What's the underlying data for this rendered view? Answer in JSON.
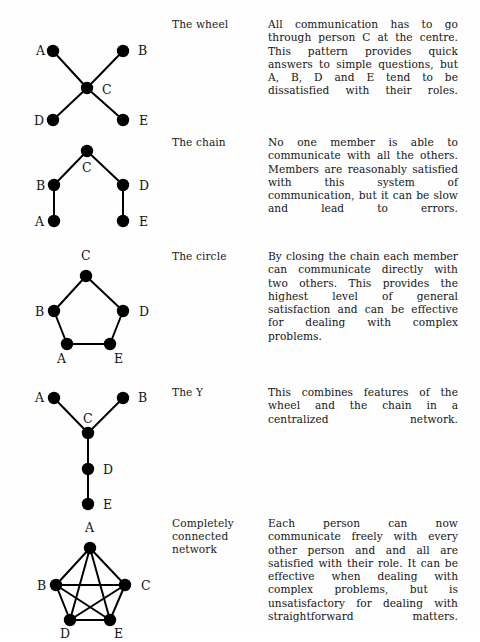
{
  "page": {
    "width": 480,
    "height": 630,
    "background": "#fefefe",
    "ink_color": "#141414",
    "node_color": "#000000",
    "edge_color": "#000000"
  },
  "rows": [
    {
      "id": "wheel",
      "label": "The wheel",
      "description": "All communication has to go through person C at the centre. This pattern provides quick answers to simple questions, but A, B, D and E tend to be dissatisfied with their roles.",
      "diagram": {
        "type": "network-graph",
        "name": "wheel-diagram",
        "nodes": [
          {
            "id": "A",
            "label": "A",
            "x": 47,
            "y": 33,
            "label_x": 30,
            "label_y": 37
          },
          {
            "id": "B",
            "label": "B",
            "x": 117,
            "y": 33,
            "label_x": 132,
            "label_y": 37
          },
          {
            "id": "C",
            "label": "C",
            "x": 81,
            "y": 70,
            "label_x": 96,
            "label_y": 76
          },
          {
            "id": "D",
            "label": "D",
            "x": 47,
            "y": 102,
            "label_x": 28,
            "label_y": 107
          },
          {
            "id": "E",
            "label": "E",
            "x": 117,
            "y": 102,
            "label_x": 133,
            "label_y": 107
          }
        ],
        "edges": [
          [
            "A",
            "C"
          ],
          [
            "B",
            "C"
          ],
          [
            "C",
            "D"
          ],
          [
            "C",
            "E"
          ]
        ]
      }
    },
    {
      "id": "chain",
      "label": "The chain",
      "description": "No one member is able to communicate with all the others. Members are reasonably satisfied with this system of communication, but it can be slow and lead to errors.",
      "diagram": {
        "type": "network-graph",
        "name": "chain-diagram",
        "nodes": [
          {
            "id": "C",
            "label": "C",
            "x": 81,
            "y": 15,
            "label_x": 76,
            "label_y": 36
          },
          {
            "id": "B",
            "label": "B",
            "x": 48,
            "y": 49,
            "label_x": 30,
            "label_y": 54
          },
          {
            "id": "D",
            "label": "D",
            "x": 117,
            "y": 49,
            "label_x": 133,
            "label_y": 54
          },
          {
            "id": "A",
            "label": "A",
            "x": 48,
            "y": 85,
            "label_x": 29,
            "label_y": 90
          },
          {
            "id": "E",
            "label": "E",
            "x": 117,
            "y": 85,
            "label_x": 133,
            "label_y": 90
          }
        ],
        "edges": [
          [
            "C",
            "B"
          ],
          [
            "C",
            "D"
          ],
          [
            "B",
            "A"
          ],
          [
            "D",
            "E"
          ]
        ]
      }
    },
    {
      "id": "circle",
      "label": "The circle",
      "description": "By closing the chain each member can communicate directly with two others. This provides the highest level of general satisfaction and can be effective for dealing with complex problems.",
      "diagram": {
        "type": "network-graph",
        "name": "circle-diagram",
        "nodes": [
          {
            "id": "C",
            "label": "C",
            "x": 80,
            "y": 26,
            "label_x": 75,
            "label_y": 10
          },
          {
            "id": "B",
            "label": "B",
            "x": 48,
            "y": 61,
            "label_x": 29,
            "label_y": 66
          },
          {
            "id": "D",
            "label": "D",
            "x": 117,
            "y": 61,
            "label_x": 133,
            "label_y": 66
          },
          {
            "id": "A",
            "label": "A",
            "x": 61,
            "y": 94,
            "label_x": 51,
            "label_y": 113
          },
          {
            "id": "E",
            "label": "E",
            "x": 104,
            "y": 94,
            "label_x": 108,
            "label_y": 113
          }
        ],
        "edges": [
          [
            "C",
            "B"
          ],
          [
            "C",
            "D"
          ],
          [
            "B",
            "A"
          ],
          [
            "D",
            "E"
          ],
          [
            "A",
            "E"
          ]
        ]
      }
    },
    {
      "id": "y",
      "label": "The Y",
      "description": "This combines features of the wheel and the chain in a centralized network.",
      "diagram": {
        "type": "network-graph",
        "name": "y-diagram",
        "nodes": [
          {
            "id": "A",
            "label": "A",
            "x": 48,
            "y": 12,
            "label_x": 29,
            "label_y": 16
          },
          {
            "id": "B",
            "label": "B",
            "x": 117,
            "y": 12,
            "label_x": 132,
            "label_y": 16
          },
          {
            "id": "C",
            "label": "C",
            "x": 82,
            "y": 47,
            "label_x": 77,
            "label_y": 37
          },
          {
            "id": "D",
            "label": "D",
            "x": 82,
            "y": 83,
            "label_x": 97,
            "label_y": 88
          },
          {
            "id": "E",
            "label": "E",
            "x": 82,
            "y": 118,
            "label_x": 97,
            "label_y": 123
          }
        ],
        "edges": [
          [
            "A",
            "C"
          ],
          [
            "B",
            "C"
          ],
          [
            "C",
            "D"
          ],
          [
            "D",
            "E"
          ]
        ]
      }
    },
    {
      "id": "completely-connected",
      "label": "Completely connected network",
      "description": "Each person can now communicate freely with every other person and and all are satisfied with their role. It can be effective when dealing with complex problems, but is unsatisfactory for dealing with straightforward matters.",
      "diagram": {
        "type": "network-graph",
        "name": "completely-connected-diagram",
        "nodes": [
          {
            "id": "A",
            "label": "A",
            "x": 84,
            "y": 31,
            "label_x": 79,
            "label_y": 15
          },
          {
            "id": "B",
            "label": "B",
            "x": 50,
            "y": 68,
            "label_x": 31,
            "label_y": 73
          },
          {
            "id": "C",
            "label": "C",
            "x": 119,
            "y": 68,
            "label_x": 135,
            "label_y": 73
          },
          {
            "id": "D",
            "label": "D",
            "x": 64,
            "y": 103,
            "label_x": 54,
            "label_y": 121
          },
          {
            "id": "E",
            "label": "E",
            "x": 104,
            "y": 103,
            "label_x": 108,
            "label_y": 121
          }
        ],
        "edges": [
          [
            "A",
            "B"
          ],
          [
            "A",
            "C"
          ],
          [
            "A",
            "D"
          ],
          [
            "A",
            "E"
          ],
          [
            "B",
            "C"
          ],
          [
            "B",
            "D"
          ],
          [
            "B",
            "E"
          ],
          [
            "C",
            "D"
          ],
          [
            "C",
            "E"
          ],
          [
            "D",
            "E"
          ]
        ]
      }
    }
  ],
  "layout": {
    "row_tops": [
      18,
      136,
      250,
      386,
      517
    ],
    "node_radius": 6.2,
    "edge_width": 2.0,
    "label_font_size": 12.5
  }
}
